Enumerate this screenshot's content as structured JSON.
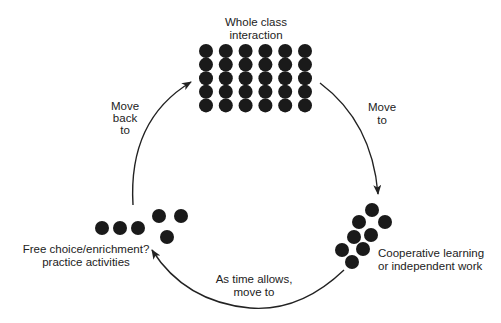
{
  "diagram": {
    "type": "cycle",
    "colors": {
      "ink": "#222222",
      "dot": "#1a1a1a",
      "background": "#ffffff"
    },
    "nodes": [
      {
        "id": "whole-class",
        "label_lines": [
          "Whole class",
          "interaction"
        ],
        "dot_grid": {
          "columns": 6,
          "rows": 5
        }
      },
      {
        "id": "cooperative",
        "label_lines": [
          "Cooperative learning",
          "or independent work"
        ],
        "dot_groups": [
          4,
          4
        ]
      },
      {
        "id": "free-choice",
        "label_lines": [
          "Free choice/enrichment?",
          "practice activities"
        ],
        "dot_groups": [
          3,
          3
        ]
      }
    ],
    "edges": [
      {
        "from": "whole-class",
        "to": "cooperative",
        "label_lines": [
          "Move",
          "to"
        ]
      },
      {
        "from": "cooperative",
        "to": "free-choice",
        "label_lines": [
          "As time allows,",
          "move to"
        ]
      },
      {
        "from": "free-choice",
        "to": "whole-class",
        "label_lines": [
          "Move",
          "back",
          "to"
        ]
      }
    ]
  }
}
